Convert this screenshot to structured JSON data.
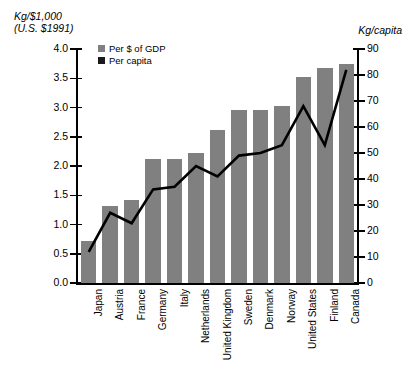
{
  "chart_data": {
    "type": "bar",
    "title": "",
    "subtitle": "",
    "xlabel": "",
    "ylabel": "Kg/$1,000 (U.S. $1991)",
    "y2label": "Kg/capita",
    "ylim": [
      0.0,
      4.0
    ],
    "y2lim": [
      0,
      90
    ],
    "grid": false,
    "legend_position": "top-left",
    "categories": [
      "Japan",
      "Austria",
      "France",
      "Germany",
      "Italy",
      "Netherlands",
      "United Kingdom",
      "Sweden",
      "Denmark",
      "Norway",
      "United States",
      "Finland",
      "Canada"
    ],
    "series": [
      {
        "name": "Per $ of GDP",
        "type": "bar",
        "axis": "left",
        "color": "#808080",
        "values": [
          0.72,
          1.32,
          1.42,
          2.12,
          2.12,
          2.22,
          2.62,
          2.95,
          2.95,
          3.02,
          3.52,
          3.68,
          3.75
        ]
      },
      {
        "name": "Per capita",
        "type": "line",
        "axis": "right",
        "color": "#000000",
        "values": [
          12,
          27,
          23,
          36,
          37,
          45,
          41,
          49,
          50,
          53,
          68,
          53,
          82
        ]
      }
    ]
  },
  "left_axis": {
    "title_line1": "Kg/$1,000",
    "title_line2": "(U.S. $1991)",
    "ticks": [
      "4.0",
      "3.5",
      "3.0",
      "2.5",
      "2.0",
      "1.5",
      "1.0",
      "0.5",
      "0.0"
    ]
  },
  "right_axis": {
    "title": "Kg/capita",
    "ticks": [
      "90",
      "80",
      "70",
      "60",
      "50",
      "40",
      "30",
      "20",
      "10",
      "0"
    ]
  },
  "legend": {
    "items": [
      {
        "label": "Per $ of GDP",
        "color": "#808080",
        "marker": "square-gray"
      },
      {
        "label": "Per capita",
        "color": "#1a1a1a",
        "marker": "square-black"
      }
    ]
  }
}
